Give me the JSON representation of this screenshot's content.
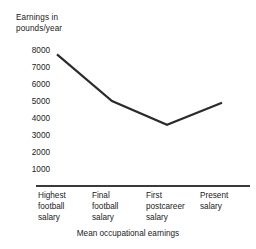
{
  "chart_data": {
    "type": "line",
    "title": "",
    "ylabel": "Earnings in\npounds/year",
    "xlabel": "Mean occupational earnings",
    "categories": [
      "Highest\nfootball\nsalary",
      "Final\nfootball\nsalary",
      "First\npostcareer\nsalary",
      "Present\nsalary"
    ],
    "values": [
      7750,
      5000,
      3600,
      4900
    ],
    "yticks": [
      8000,
      7000,
      6000,
      5000,
      4000,
      3000,
      2000,
      1000
    ],
    "ytick_labels": [
      "8000",
      "7000",
      "6000",
      "5000",
      "4000",
      "3000",
      "2000",
      "1000"
    ],
    "ylim": [
      0,
      8000
    ],
    "grid": false,
    "legend": false,
    "legend_position": "none",
    "series": [
      {
        "name": "Mean occupational earnings",
        "values": [
          7750,
          5000,
          3600,
          4900
        ]
      }
    ],
    "line_color": "#2b2b2b",
    "axis_color": "#3a3a3a",
    "background_color": "#ffffff"
  },
  "axes": {
    "y_title": "Earnings in\npounds/year",
    "x_title": "Mean occupational earnings"
  }
}
